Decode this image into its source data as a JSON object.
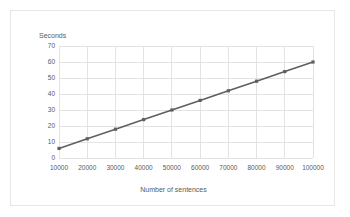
{
  "chart_data": {
    "type": "line",
    "title": "",
    "xlabel": "Number of sentences",
    "ylabel": "Seconds",
    "x": [
      10000,
      20000,
      30000,
      40000,
      50000,
      60000,
      70000,
      80000,
      90000,
      100000
    ],
    "values": [
      6,
      12,
      18,
      24,
      30,
      36,
      42,
      48,
      54,
      60
    ],
    "series": [
      {
        "name": "Seconds",
        "values": [
          6,
          12,
          18,
          24,
          30,
          36,
          42,
          48,
          54,
          60
        ]
      }
    ],
    "x_tick_labels": [
      "10000",
      "20000",
      "30000",
      "40000",
      "50000",
      "60000",
      "70000",
      "80000",
      "90000",
      "100000"
    ],
    "y_tick_labels": [
      "0",
      "10",
      "20",
      "30",
      "40",
      "50",
      "60",
      "70"
    ],
    "y_ticks": [
      0,
      10,
      20,
      30,
      40,
      50,
      60,
      70
    ],
    "ylim": [
      0,
      70
    ],
    "xlim": [
      10000,
      100000
    ],
    "grid": true,
    "grid_x": true,
    "grid_y": true,
    "legend": false,
    "legend_position": "none",
    "marker": "square",
    "line_color": "#5f5f5f",
    "marker_color": "#5f5f5f",
    "grid_color": "#e3e3e3",
    "text_color": "#5a5a5a",
    "border_color": "#e6e6e6",
    "background_color": "#ffffff"
  }
}
